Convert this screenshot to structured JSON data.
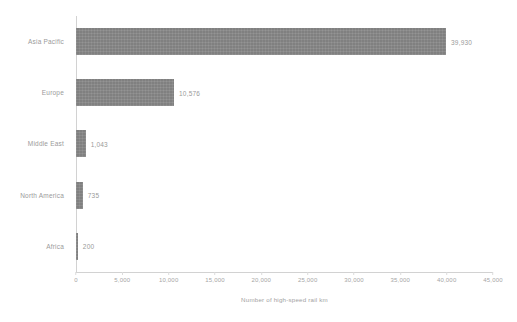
{
  "chart_data": {
    "type": "bar",
    "orientation": "horizontal",
    "title": "",
    "xlabel": "Number of high-speed rail km",
    "ylabel": "",
    "categories": [
      "Asia Pacific",
      "Europe",
      "Middle East",
      "North America",
      "Africa"
    ],
    "values": [
      39930,
      10576,
      1043,
      735,
      200
    ],
    "value_labels": [
      "39,930",
      "10,576",
      "1,043",
      "735",
      "200"
    ],
    "xlim": [
      0,
      45000
    ],
    "xticks": [
      0,
      5000,
      10000,
      15000,
      20000,
      25000,
      30000,
      35000,
      40000,
      45000
    ],
    "xtick_labels": [
      "0",
      "5,000",
      "10,000",
      "15,000",
      "20,000",
      "25,000",
      "30,000",
      "35,000",
      "40,000",
      "45,000"
    ],
    "grid": false,
    "legend": null,
    "bar_color": "#808080",
    "axis_color": "#d2d2d2",
    "text_color": "#9a9a9a",
    "background_color": "#ffffff"
  }
}
